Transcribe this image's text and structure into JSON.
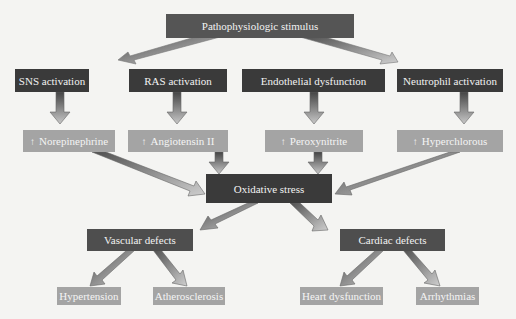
{
  "diagram": {
    "root": {
      "label": "Pathophysiologic stimulus"
    },
    "activations": [
      {
        "label": "SNS activation"
      },
      {
        "label": "RAS activation"
      },
      {
        "label": "Endothelial dysfunction"
      },
      {
        "label": "Neutrophil activation"
      }
    ],
    "mediators": [
      {
        "arrow": "↑",
        "label": "Norepinephrine"
      },
      {
        "arrow": "↑",
        "label": "Angiotensin II"
      },
      {
        "arrow": "↑",
        "label": "Peroxynitrite"
      },
      {
        "arrow": "↑",
        "label": "Hyperchlorous"
      }
    ],
    "central": {
      "label": "Oxidative stress"
    },
    "defects": [
      {
        "label": "Vascular defects"
      },
      {
        "label": "Cardiac defects"
      }
    ],
    "outcomes": [
      {
        "label": "Hypertension"
      },
      {
        "label": "Atherosclerosis"
      },
      {
        "label": "Heart dysfunction"
      },
      {
        "label": "Arrhythmias"
      }
    ],
    "colors": {
      "background": "#f4f4f2",
      "root_box": "#555555",
      "activation_box": "#3a3a3a",
      "mediator_box": "#a4a4a4",
      "central_box": "#3a3a3a",
      "defect_box": "#4e4e4e",
      "outcome_box": "#a4a4a4",
      "arrow_fill": "#b8b8b8",
      "arrow_dark": "#555555"
    }
  }
}
